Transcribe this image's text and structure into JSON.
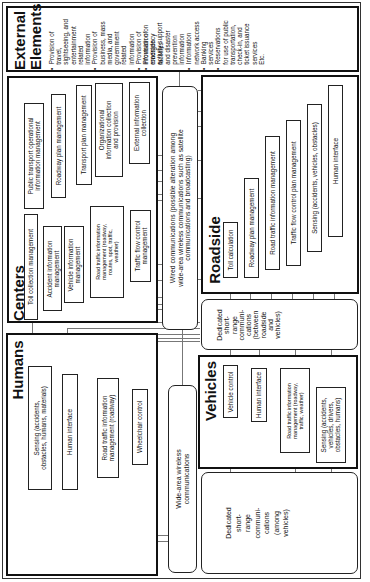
{
  "diagram": {
    "external_elements": {
      "title_line1": "External",
      "title_line2": "Elements",
      "items": [
        "Provision of travel, sightseeing, and entertainment related information",
        "Provision of business, mass media, and government related information",
        "Provision of information on roadside facilities",
        "Provision of emergency activity support and disaster prevention information",
        "Information network access",
        "Banking services",
        "Reservations for use of public transportation, check-in, and ticket issuance services"
      ],
      "col1": "•  Provision of\n   travel,\n   sightseeing, and\n   entertainment\n   related\n   information\n•  Provision of\n   business, mass\n   media, and\n   government\n   related\n   information\n•  Provision of\n   information on\n   roadside\n   facilities",
      "col2": "•  Provision of\n   emergency\n   activity support\n   and disaster\n   prevention\n   information\n•  Information\n   network access\n•  Banking\n   services\n•  Reservations\n   for use of public\n   transportation,\n   check-in, and\n   ticket issuance\n   services\n   Etc.",
      "etc": "Etc."
    },
    "centers": {
      "title": "Centers",
      "boxes": [
        "Toll collection management",
        "Accident information\nmanagement",
        "Vehicle information\nmanagement",
        "Road traffic information\nmanagement (roadway,\nroutes, spot, traffic,\nweather)",
        "Traffic flow control\nmanagement",
        "Public transport operational\ninformation management",
        "Roadway plan management",
        "Transport plan management",
        "Organizational\ninformation collection\nand provision",
        "External information\ncollection"
      ]
    },
    "wired_communications": {
      "label": "Wired communications (possible alteration among\nwide-area wireless communications such as satellite\ncommunications and broadcasting)"
    },
    "roadside": {
      "title": "Roadside",
      "boxes": [
        "Toll calculation",
        "Roadway plan management",
        "Road traffic information management",
        "Traffic flow control plan management",
        "Sensing (accidents, vehicles, obstacles)",
        "Human interface"
      ]
    },
    "dsrc_roadside_vehicles": {
      "label": "Dedicated\nshort-\nrange\ncommuni-\ncations\n(between\nroadside\nand\nvehicles)"
    },
    "humans": {
      "title": "Humans",
      "boxes": [
        "Sensing (accidents,\nobstacles, humans, materials)",
        "Human interface",
        "Road traffic information\nmanagement (roadway)",
        "Wheelchair control"
      ]
    },
    "wide_area_wireless": {
      "label": "Wide-area wireless\ncommunications"
    },
    "vehicles": {
      "title": "Vehicles",
      "boxes": [
        "Vehicle control",
        "Human interface",
        "Road traffic information\nmanagement (roadway,\ntraffic, weather)",
        "Sensing (accidents,\nvehicles, drivers,\nobstacles, humans)"
      ]
    },
    "dsrc_among_vehicles": {
      "label": "Dedicated\nshort-\nrange\ncommuni-\ncations\n(among\nvehicles)"
    }
  }
}
